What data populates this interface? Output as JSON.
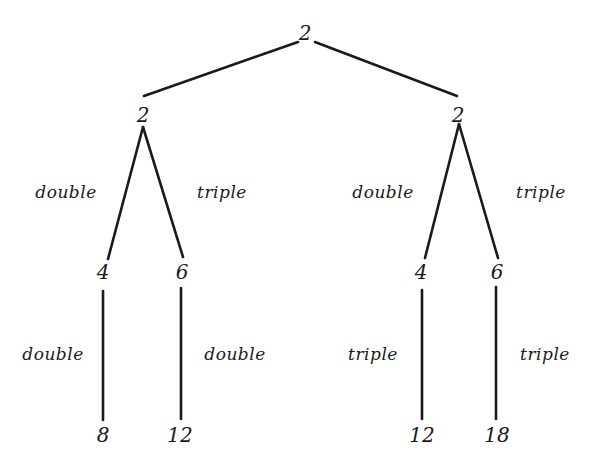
{
  "diagram": {
    "type": "tree",
    "stroke_color": "#1a1a1a",
    "root": {
      "value": "2",
      "x": 305,
      "y": 33
    },
    "level1": [
      {
        "value": "2",
        "x": 143,
        "y": 115
      },
      {
        "value": "2",
        "x": 458,
        "y": 115
      }
    ],
    "level2": [
      {
        "value": "4",
        "x": 103,
        "y": 272
      },
      {
        "value": "6",
        "x": 182,
        "y": 272
      },
      {
        "value": "4",
        "x": 421,
        "y": 272
      },
      {
        "value": "6",
        "x": 497,
        "y": 272
      }
    ],
    "leaves": [
      {
        "value": "8",
        "x": 103,
        "y": 435
      },
      {
        "value": "12",
        "x": 180,
        "y": 435
      },
      {
        "value": "12",
        "x": 422,
        "y": 435
      },
      {
        "value": "18",
        "x": 497,
        "y": 435
      }
    ],
    "edge_labels_level2": [
      {
        "text": "double",
        "x": 66,
        "y": 192
      },
      {
        "text": "triple",
        "x": 222,
        "y": 192
      },
      {
        "text": "double",
        "x": 383,
        "y": 192
      },
      {
        "text": "triple",
        "x": 541,
        "y": 192
      }
    ],
    "edge_labels_level3": [
      {
        "text": "double",
        "x": 53,
        "y": 354
      },
      {
        "text": "double",
        "x": 235,
        "y": 354
      },
      {
        "text": "triple",
        "x": 373,
        "y": 354
      },
      {
        "text": "triple",
        "x": 545,
        "y": 354
      }
    ]
  }
}
